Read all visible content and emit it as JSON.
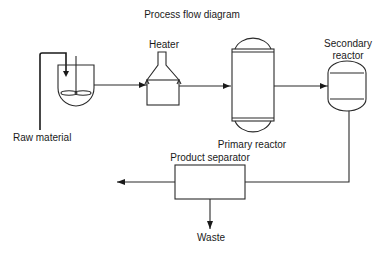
{
  "title": "Process flow diagram",
  "nodes": {
    "raw_material": {
      "label": "Raw material"
    },
    "mixing_tank": {
      "label": ""
    },
    "heater": {
      "label": "Heater"
    },
    "primary_reactor": {
      "label": "Primary reactor"
    },
    "secondary_reactor": {
      "label_line1": "Secondary",
      "label_line2": "reactor"
    },
    "product_separator": {
      "label": "Product separator"
    },
    "waste": {
      "label": "Waste"
    }
  },
  "flows": [
    {
      "from": "raw_material",
      "to": "mixing_tank"
    },
    {
      "from": "mixing_tank",
      "to": "heater"
    },
    {
      "from": "heater",
      "to": "primary_reactor"
    },
    {
      "from": "primary_reactor",
      "to": "secondary_reactor"
    },
    {
      "from": "secondary_reactor",
      "to": "product_separator"
    },
    {
      "from": "product_separator",
      "to": "product_out"
    },
    {
      "from": "product_separator",
      "to": "waste"
    }
  ],
  "colors": {
    "line": "#2a2a2a",
    "background": "#ffffff"
  }
}
